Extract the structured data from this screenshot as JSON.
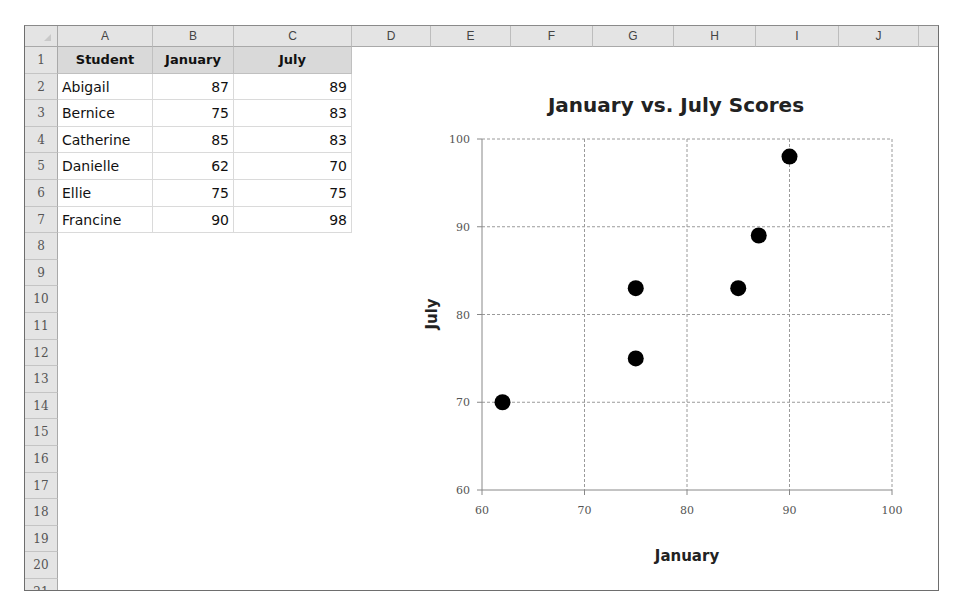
{
  "spreadsheet": {
    "column_headers": [
      "A",
      "B",
      "C",
      "D",
      "E",
      "F",
      "G",
      "H",
      "I",
      "J",
      ""
    ],
    "row_headers": [
      "1",
      "2",
      "3",
      "4",
      "5",
      "6",
      "7",
      "8",
      "9",
      "10",
      "11",
      "12",
      "13",
      "14",
      "15",
      "16",
      "17",
      "18",
      "19",
      "20",
      "21"
    ],
    "table": {
      "headers": [
        "Student",
        "January",
        "July"
      ],
      "rows": [
        [
          "Abigail",
          "87",
          "89"
        ],
        [
          "Bernice",
          "75",
          "83"
        ],
        [
          "Catherine",
          "85",
          "83"
        ],
        [
          "Danielle",
          "62",
          "70"
        ],
        [
          "Ellie",
          "75",
          "75"
        ],
        [
          "Francine",
          "90",
          "98"
        ]
      ]
    }
  },
  "chart_data": {
    "type": "scatter",
    "title": "January vs. July Scores",
    "xlabel": "January",
    "ylabel": "July",
    "xlim": [
      60,
      100
    ],
    "ylim": [
      60,
      100
    ],
    "xticks": [
      60,
      70,
      80,
      90,
      100
    ],
    "yticks": [
      60,
      70,
      80,
      90,
      100
    ],
    "grid": true,
    "legend": "none",
    "marker_color": "#000000",
    "points": [
      {
        "label": "Abigail",
        "x": 87,
        "y": 89
      },
      {
        "label": "Bernice",
        "x": 75,
        "y": 83
      },
      {
        "label": "Catherine",
        "x": 85,
        "y": 83
      },
      {
        "label": "Danielle",
        "x": 62,
        "y": 70
      },
      {
        "label": "Ellie",
        "x": 75,
        "y": 75
      },
      {
        "label": "Francine",
        "x": 90,
        "y": 98
      }
    ]
  }
}
